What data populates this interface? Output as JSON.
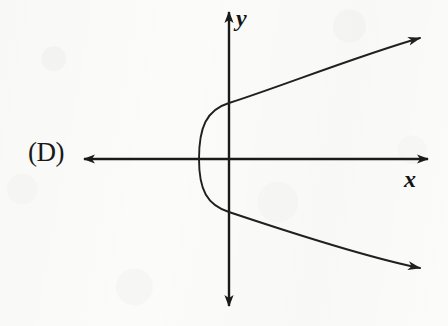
{
  "figure": {
    "kind": "coordinate-plane-graph",
    "choice_label": "(D)",
    "curve_description": "rightward-opening parabola",
    "axis_labels": {
      "x": "x",
      "y": "y"
    },
    "colors": {
      "background": "#fbfbfa",
      "ink": "#1a1a1a",
      "curve": "#202020"
    },
    "geometry": {
      "canvas": {
        "width": 448,
        "height": 326
      },
      "origin": {
        "x": 229,
        "y": 159
      },
      "x_axis": {
        "y": 159,
        "x_start": 78,
        "x_end": 434,
        "arrow_start": true,
        "arrow_end": true
      },
      "y_axis": {
        "x": 229,
        "y_start": 6,
        "y_end": 312,
        "arrow_start": true,
        "arrow_end": true
      },
      "parabola": {
        "vertex": {
          "x": 199,
          "y": 159
        },
        "opens": "right",
        "y_axis_crossings": [
          {
            "x": 229,
            "y": 103
          },
          {
            "x": 229,
            "y": 212
          }
        ],
        "upper_arm_end": {
          "x": 428,
          "y": 35
        },
        "lower_arm_end": {
          "x": 428,
          "y": 270
        },
        "arrow_upper": true,
        "arrow_lower": true
      }
    }
  }
}
